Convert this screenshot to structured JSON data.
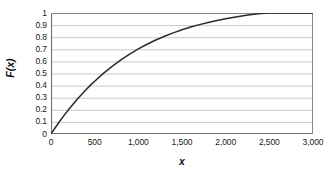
{
  "chart_data": {
    "type": "line",
    "title": "",
    "subtitle": "",
    "xlabel": "x",
    "ylabel": "F(x)",
    "xlim": [
      0,
      3000
    ],
    "ylim": [
      0,
      1
    ],
    "grid": true,
    "grid_axis": "y",
    "legend": false,
    "legend_position": "none",
    "xticks": [
      0,
      500,
      1000,
      1500,
      2000,
      2500,
      3000
    ],
    "xticklabels": [
      "0",
      "500",
      "1,000",
      "1,500",
      "2,000",
      "2,500",
      "3,000"
    ],
    "yticks": [
      0,
      0.1,
      0.2,
      0.3,
      0.4,
      0.5,
      0.6,
      0.7,
      0.8,
      0.9,
      1
    ],
    "yticklabels": [
      "0",
      "0.1",
      "0.2",
      "0.3",
      "0.4",
      "0.5",
      "0.6",
      "0.7",
      "0.8",
      "0.9",
      "1"
    ],
    "series": [
      {
        "name": "F(x)",
        "color": "#2b2b2b",
        "x": [
          0,
          50,
          100,
          150,
          200,
          250,
          300,
          350,
          400,
          450,
          500,
          600,
          700,
          800,
          900,
          1000,
          1100,
          1200,
          1300,
          1400,
          1500,
          1600,
          1700,
          1800,
          1900,
          2000,
          2100,
          2200,
          2300,
          2400,
          2500,
          2600,
          2700,
          2800,
          2900,
          3000
        ],
        "values": [
          0,
          0.054,
          0.105,
          0.154,
          0.2,
          0.244,
          0.287,
          0.327,
          0.365,
          0.402,
          0.436,
          0.501,
          0.559,
          0.612,
          0.66,
          0.703,
          0.742,
          0.777,
          0.808,
          0.836,
          0.862,
          0.884,
          0.904,
          0.922,
          0.938,
          0.953,
          0.965,
          0.977,
          0.987,
          0.996,
          1.004,
          1.011,
          1.018,
          1.024,
          1.029,
          1.034
        ]
      }
    ],
    "colors": {
      "curve": "#2b2b2b",
      "gridline": "#c9c9c9",
      "axis": "#6e6e6e",
      "frame": "#8a8a8a",
      "text": "#1a1a1a",
      "background": "#ffffff"
    }
  }
}
